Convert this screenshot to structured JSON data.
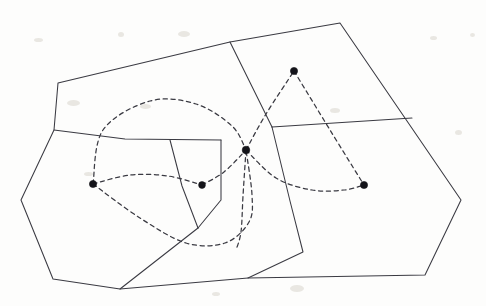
{
  "figure": {
    "kind": "line-diagram",
    "background_color": "#fdfdfc",
    "solid_stroke_color": "#3a3a42",
    "dashed_stroke_color": "#3a3a42",
    "vertex_color": "#14141a",
    "width": 486,
    "height": 306
  },
  "chart_data": {
    "type": "diagram",
    "xlabel": "",
    "ylabel": "",
    "xlim": [
      0,
      486
    ],
    "ylim": [
      0,
      306
    ],
    "grid": false,
    "legend": "none",
    "vertices": [
      {
        "name": "top-dot",
        "x": 294,
        "y": 71,
        "radius": 3.6
      },
      {
        "name": "hub-dot",
        "x": 246,
        "y": 150,
        "radius": 3.8
      },
      {
        "name": "left-dot",
        "x": 93,
        "y": 184,
        "radius": 3.6
      },
      {
        "name": "middle-dot",
        "x": 202,
        "y": 185,
        "radius": 3.4
      },
      {
        "name": "right-dot",
        "x": 364,
        "y": 185,
        "radius": 3.6
      }
    ],
    "solid_polygon_outline": [
      [
        58,
        83
      ],
      [
        230,
        42
      ],
      [
        340,
        23
      ],
      [
        461,
        200
      ],
      [
        425,
        275
      ],
      [
        248,
        278
      ],
      [
        120,
        289
      ],
      [
        53,
        279
      ],
      [
        21,
        200
      ],
      [
        54,
        130
      ]
    ],
    "solid_interior_edges": [
      {
        "name": "top-divider",
        "points": [
          [
            230,
            42
          ],
          [
            272,
            127
          ]
        ]
      },
      {
        "name": "upper-left-chord",
        "points": [
          [
            54,
            130
          ],
          [
            125,
            139
          ],
          [
            221,
            140
          ]
        ]
      },
      {
        "name": "inner-cell-right",
        "points": [
          [
            221,
            140
          ],
          [
            221,
            200
          ],
          [
            198,
            228
          ]
        ]
      },
      {
        "name": "inner-cell-spine",
        "points": [
          [
            170,
            140
          ],
          [
            182,
            186
          ],
          [
            198,
            228
          ]
        ]
      },
      {
        "name": "long-diagonal",
        "points": [
          [
            198,
            228
          ],
          [
            120,
            289
          ]
        ]
      },
      {
        "name": "right-horizontal",
        "points": [
          [
            272,
            127
          ],
          [
            412,
            118
          ]
        ]
      },
      {
        "name": "center-descent",
        "points": [
          [
            272,
            127
          ],
          [
            290,
            201
          ],
          [
            303,
            252
          ],
          [
            248,
            278
          ]
        ]
      }
    ],
    "dashed_edges": [
      {
        "name": "left-dot-to-hub-upper-arc",
        "from": "left-dot",
        "to": "hub-dot",
        "path": [
          [
            93,
            184
          ],
          [
            103,
            130
          ],
          [
            150,
            101
          ],
          [
            196,
            104
          ],
          [
            232,
            126
          ],
          [
            246,
            150
          ]
        ]
      },
      {
        "name": "left-dot-to-middle-dot",
        "from": "left-dot",
        "to": "middle-dot",
        "path": [
          [
            93,
            184
          ],
          [
            130,
            175
          ],
          [
            168,
            176
          ],
          [
            202,
            185
          ]
        ]
      },
      {
        "name": "middle-dot-to-hub",
        "from": "middle-dot",
        "to": "hub-dot",
        "path": [
          [
            202,
            185
          ],
          [
            224,
            172
          ],
          [
            246,
            150
          ]
        ]
      },
      {
        "name": "left-dot-to-lower-arc",
        "from": "left-dot",
        "to": "hub-dot",
        "path": [
          [
            93,
            184
          ],
          [
            140,
            218
          ],
          [
            186,
            243
          ],
          [
            225,
            243
          ],
          [
            249,
            222
          ],
          [
            252,
            195
          ],
          [
            246,
            150
          ]
        ]
      },
      {
        "name": "hub-to-top-dot",
        "from": "hub-dot",
        "to": "top-dot",
        "path": [
          [
            246,
            150
          ],
          [
            266,
            114
          ],
          [
            294,
            71
          ]
        ]
      },
      {
        "name": "top-dot-to-right-dot",
        "from": "top-dot",
        "to": "right-dot",
        "path": [
          [
            294,
            71
          ],
          [
            330,
            130
          ],
          [
            364,
            185
          ]
        ]
      },
      {
        "name": "hub-to-right-dot-arc",
        "from": "hub-dot",
        "to": "right-dot",
        "path": [
          [
            246,
            150
          ],
          [
            276,
            178
          ],
          [
            312,
            190
          ],
          [
            344,
            190
          ],
          [
            364,
            185
          ]
        ]
      },
      {
        "name": "hub-downward-tail",
        "from": "hub-dot",
        "to": "lower-loop",
        "path": [
          [
            246,
            150
          ],
          [
            243,
            196
          ],
          [
            241,
            232
          ],
          [
            236,
            250
          ]
        ]
      }
    ]
  },
  "scan_artifacts": {
    "description": "faint ghost speckles from the paper scan",
    "specks": [
      {
        "x": 34,
        "y": 38,
        "w": 9,
        "h": 4
      },
      {
        "x": 118,
        "y": 32,
        "w": 6,
        "h": 5
      },
      {
        "x": 178,
        "y": 31,
        "w": 12,
        "h": 6
      },
      {
        "x": 430,
        "y": 36,
        "w": 7,
        "h": 4
      },
      {
        "x": 470,
        "y": 33,
        "w": 5,
        "h": 4
      },
      {
        "x": 67,
        "y": 100,
        "w": 13,
        "h": 6
      },
      {
        "x": 140,
        "y": 104,
        "w": 11,
        "h": 5
      },
      {
        "x": 330,
        "y": 108,
        "w": 10,
        "h": 5
      },
      {
        "x": 455,
        "y": 130,
        "w": 7,
        "h": 5
      },
      {
        "x": 84,
        "y": 172,
        "w": 9,
        "h": 4
      },
      {
        "x": 290,
        "y": 285,
        "w": 14,
        "h": 7
      },
      {
        "x": 212,
        "y": 292,
        "w": 8,
        "h": 4
      }
    ]
  }
}
